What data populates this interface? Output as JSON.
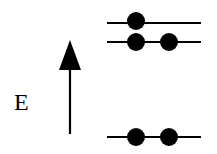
{
  "axis": {
    "label": "E",
    "direction": "up"
  },
  "levels": [
    {
      "name": "level-top",
      "y": 23,
      "electrons": 1
    },
    {
      "name": "level-middle",
      "y": 42,
      "electrons": 2
    },
    {
      "name": "level-bottom",
      "y": 137,
      "electrons": 2
    }
  ],
  "colors": {
    "line": "#000000",
    "electron": "#000000",
    "background": "#ffffff"
  }
}
